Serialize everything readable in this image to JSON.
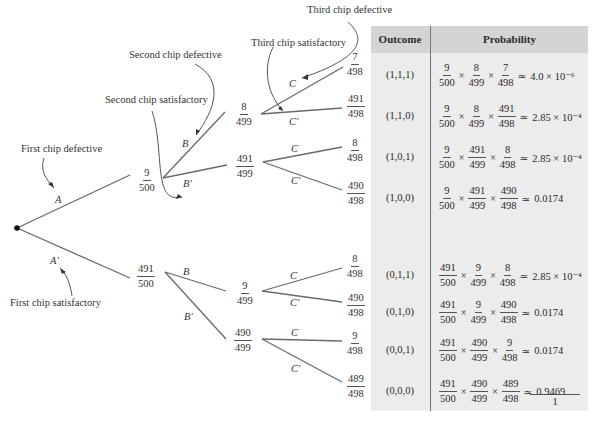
{
  "annotations": {
    "third_defective": "Third chip defective",
    "third_satisfactory": "Third chip satisfactory",
    "second_defective": "Second chip defective",
    "second_satisfactory": "Second chip satisfactory",
    "first_defective": "First chip defective",
    "first_satisfactory": "First chip satisfactory"
  },
  "events": {
    "A": "A",
    "A_prime": "A′",
    "B": "B",
    "B_prime": "B′",
    "C": "C",
    "C_prime": "C′"
  },
  "tree": {
    "level1": [
      {
        "num": "9",
        "den": "500"
      },
      {
        "num": "491",
        "den": "500"
      }
    ],
    "level2": [
      {
        "num": "8",
        "den": "499"
      },
      {
        "num": "491",
        "den": "499"
      },
      {
        "num": "9",
        "den": "499"
      },
      {
        "num": "490",
        "den": "499"
      }
    ],
    "level3": [
      {
        "num": "7",
        "den": "498"
      },
      {
        "num": "491",
        "den": "498"
      },
      {
        "num": "8",
        "den": "498"
      },
      {
        "num": "490",
        "den": "498"
      },
      {
        "num": "8",
        "den": "498"
      },
      {
        "num": "490",
        "den": "498"
      },
      {
        "num": "9",
        "den": "498"
      },
      {
        "num": "489",
        "den": "498"
      }
    ]
  },
  "table": {
    "headers": {
      "outcome": "Outcome",
      "probability": "Probability"
    },
    "times": "×",
    "approx": "≃",
    "rows": [
      {
        "outcome": "(1,1,1)",
        "f": [
          [
            "9",
            "500"
          ],
          [
            "8",
            "499"
          ],
          [
            "7",
            "498"
          ]
        ],
        "result": "4.0 × 10⁻⁶"
      },
      {
        "outcome": "(1,1,0)",
        "f": [
          [
            "9",
            "500"
          ],
          [
            "8",
            "499"
          ],
          [
            "491",
            "498"
          ]
        ],
        "result": "2.85 × 10⁻⁴"
      },
      {
        "outcome": "(1,0,1)",
        "f": [
          [
            "9",
            "500"
          ],
          [
            "491",
            "499"
          ],
          [
            "8",
            "498"
          ]
        ],
        "result": "2.85 × 10⁻⁴"
      },
      {
        "outcome": "(1,0,0)",
        "f": [
          [
            "9",
            "500"
          ],
          [
            "491",
            "499"
          ],
          [
            "490",
            "498"
          ]
        ],
        "result": "0.0174"
      },
      {
        "outcome": "(0,1,1)",
        "f": [
          [
            "491",
            "500"
          ],
          [
            "9",
            "499"
          ],
          [
            "8",
            "498"
          ]
        ],
        "result": "2.85 × 10⁻⁴"
      },
      {
        "outcome": "(0,1,0)",
        "f": [
          [
            "491",
            "500"
          ],
          [
            "9",
            "499"
          ],
          [
            "490",
            "498"
          ]
        ],
        "result": "0.0174"
      },
      {
        "outcome": "(0,0,1)",
        "f": [
          [
            "491",
            "500"
          ],
          [
            "490",
            "499"
          ],
          [
            "9",
            "498"
          ]
        ],
        "result": "0.0174"
      },
      {
        "outcome": "(0,0,0)",
        "f": [
          [
            "491",
            "500"
          ],
          [
            "490",
            "499"
          ],
          [
            "489",
            "498"
          ]
        ],
        "result": "0.9469"
      }
    ],
    "total": "1"
  }
}
